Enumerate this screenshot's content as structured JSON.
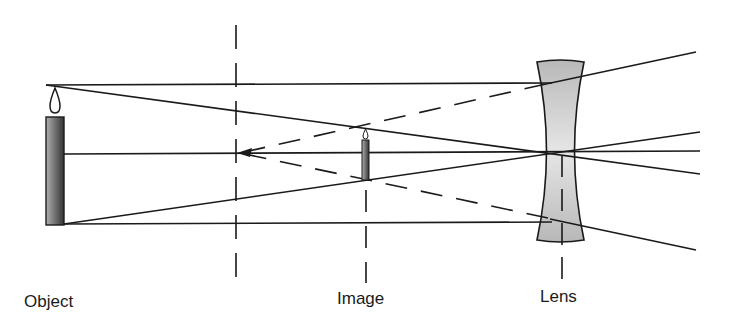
{
  "diagram": {
    "labels": {
      "object": "Object",
      "image": "Image",
      "lens": "Lens"
    },
    "colors": {
      "line": "#1a1a1a",
      "lens_fill": "#c4c4c4",
      "candle_dark": "#3a3a3a",
      "candle_light": "#a8a8a8"
    }
  }
}
